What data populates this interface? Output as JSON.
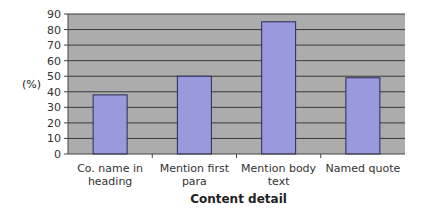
{
  "chart_data": {
    "type": "bar",
    "title": "",
    "xlabel": "Content detail",
    "ylabel": "(%)",
    "categories": [
      [
        "Co. name in",
        "heading"
      ],
      [
        "Mention first",
        "para"
      ],
      [
        "Mention body",
        "text"
      ],
      [
        "Named quote"
      ]
    ],
    "values": [
      38,
      50,
      85,
      49
    ],
    "ylim": [
      0,
      90
    ],
    "yticks": [
      0,
      10,
      20,
      30,
      40,
      50,
      60,
      70,
      80,
      90
    ],
    "grid": true,
    "legend": "none",
    "colors": {
      "bar_fill": "#9999dd",
      "bar_stroke": "#2a2a55",
      "plot_bg": "#acacac",
      "gridline": "#3a3a3a"
    }
  }
}
